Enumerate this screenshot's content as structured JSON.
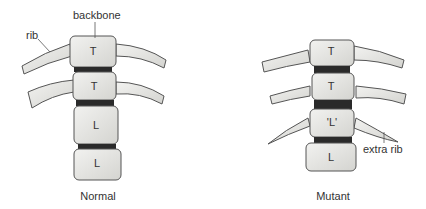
{
  "labels": {
    "backbone": "backbone",
    "rib": "rib",
    "extra_rib": "extra rib"
  },
  "normal": {
    "caption": "Normal",
    "vertebrae": [
      "T",
      "T",
      "L",
      "L"
    ]
  },
  "mutant": {
    "caption": "Mutant",
    "vertebrae": [
      "T",
      "T",
      "'L'",
      "L"
    ]
  },
  "colors": {
    "bone_fill": "#e6e6e3",
    "bone_stroke": "#555555",
    "disc": "#2a2a2a",
    "text": "#333333"
  }
}
